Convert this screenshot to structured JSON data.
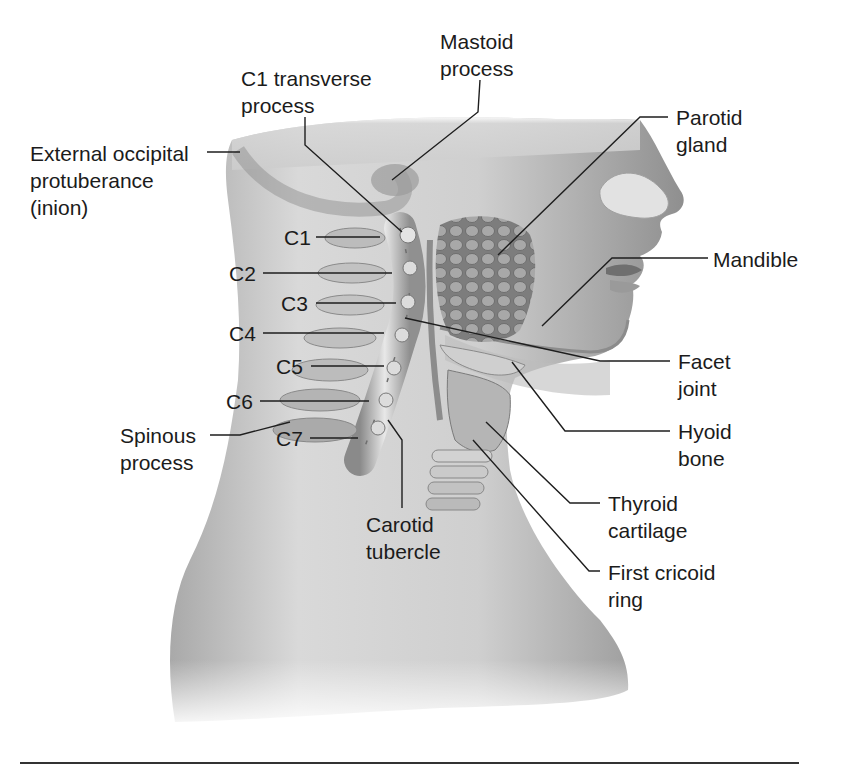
{
  "figure": {
    "colors": {
      "background": "#ffffff",
      "text": "#1b1b1b",
      "leader_line": "#1e1e1e",
      "skin_light": "#e6e6e6",
      "skin_mid": "#bdbdbd",
      "skin_dark": "#7a7a7a"
    }
  },
  "labels": {
    "mastoid": "Mastoid\nprocess",
    "c1_transverse": "C1 transverse\nprocess",
    "parotid": "Parotid\ngland",
    "occipital": "External occipital\nprotuberance\n(inion)",
    "c1": "C1",
    "c2": "C2",
    "c3": "C3",
    "c4": "C4",
    "c5": "C5",
    "c6": "C6",
    "c7": "C7",
    "mandible": "Mandible",
    "facet": "Facet\njoint",
    "hyoid": "Hyoid\nbone",
    "spinous": "Spinous\nprocess",
    "carotid": "Carotid\ntubercle",
    "thyroid": "Thyroid\ncartilage",
    "cricoid": "First cricoid\nring"
  }
}
